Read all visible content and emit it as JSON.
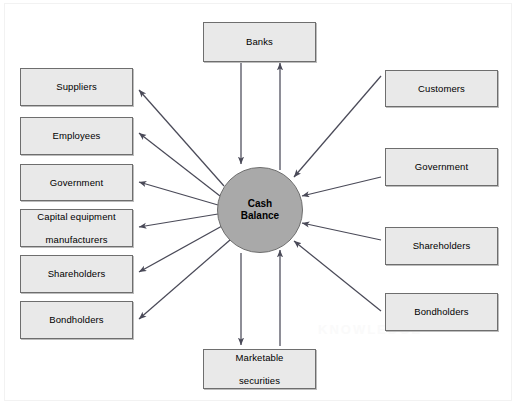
{
  "diagram": {
    "center": {
      "name": "cash-balance",
      "label_line1": "Cash",
      "label_line2": "Balance",
      "fill": "#a9a9a9",
      "stroke": "#6e6e6e"
    },
    "style": {
      "box_fill": "#e9e9e9",
      "box_stroke": "#6e6e6e",
      "arrow_color": "#4a4a58",
      "background": "#ffffff",
      "frame_stroke": "#f2f2f2"
    },
    "outflow_nodes": [
      {
        "id": "suppliers",
        "label": "Suppliers",
        "direction": "outflow",
        "side": "left"
      },
      {
        "id": "employees",
        "label": "Employees",
        "direction": "outflow",
        "side": "left"
      },
      {
        "id": "government-left",
        "label": "Government",
        "direction": "outflow",
        "side": "left"
      },
      {
        "id": "capital-equipment-manufacturers",
        "label_line1": "Capital equipment",
        "label_line2": "manufacturers",
        "direction": "outflow",
        "side": "left"
      },
      {
        "id": "shareholders-left",
        "label": "Shareholders",
        "direction": "outflow",
        "side": "left"
      },
      {
        "id": "bondholders-left",
        "label": "Bondholders",
        "direction": "outflow",
        "side": "left"
      }
    ],
    "inflow_nodes": [
      {
        "id": "customers",
        "label": "Customers",
        "direction": "inflow",
        "side": "right"
      },
      {
        "id": "government-right",
        "label": "Government",
        "direction": "inflow",
        "side": "right"
      },
      {
        "id": "shareholders-right",
        "label": "Shareholders",
        "direction": "inflow",
        "side": "right"
      },
      {
        "id": "bondholders-right",
        "label": "Bondholders",
        "direction": "inflow",
        "side": "right"
      }
    ],
    "bidirectional_nodes": [
      {
        "id": "banks",
        "label": "Banks",
        "direction": "bidirectional",
        "side": "top"
      },
      {
        "id": "marketable-securities",
        "label_line1": "Marketable",
        "label_line2": "securities",
        "direction": "bidirectional",
        "side": "bottom"
      }
    ],
    "watermark": "KNOWLEDGE"
  }
}
